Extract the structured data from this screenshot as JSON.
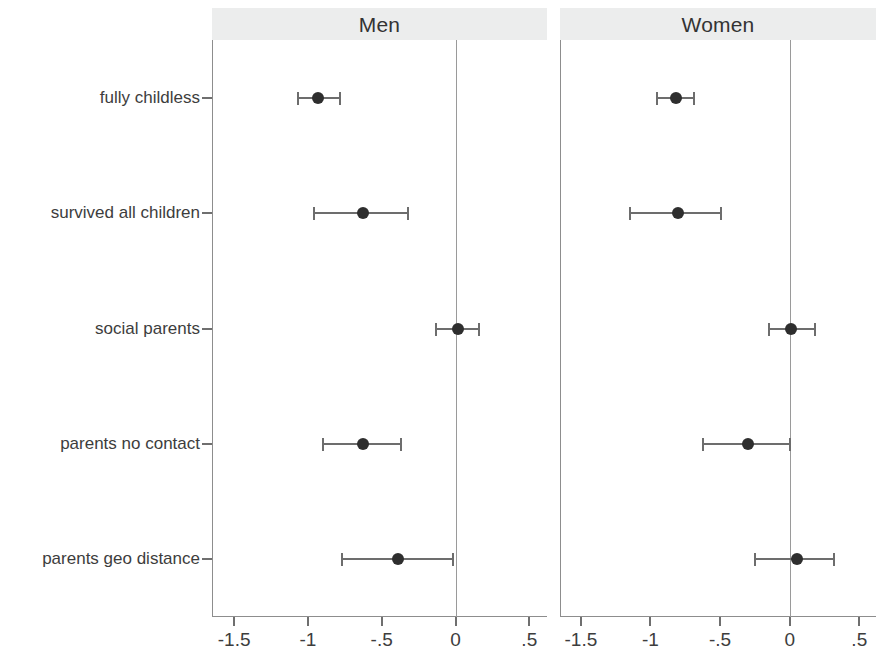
{
  "chart_data": {
    "type": "scatter",
    "title": "",
    "subtitle": "",
    "xlabel": "",
    "ylabel": "",
    "grid": false,
    "legend_position": "none",
    "reference_line": 0,
    "categories": [
      "fully childless",
      "survived all children",
      "social parents",
      "parents no contact",
      "parents geo distance"
    ],
    "panels": [
      {
        "name": "men",
        "label": "Men",
        "xlim": [
          -1.65,
          0.62
        ],
        "xticks": [
          -1.5,
          -1,
          -0.5,
          0,
          0.5
        ],
        "xticklabels": [
          "-1.5",
          "-1",
          "-.5",
          "0",
          ".5"
        ],
        "series": [
          {
            "category": "fully childless",
            "value": -0.93,
            "ci_low": -1.07,
            "ci_high": -0.78
          },
          {
            "category": "survived all children",
            "value": -0.63,
            "ci_low": -0.96,
            "ci_high": -0.32
          },
          {
            "category": "social parents",
            "value": 0.02,
            "ci_low": -0.13,
            "ci_high": 0.16
          },
          {
            "category": "parents no contact",
            "value": -0.63,
            "ci_low": -0.9,
            "ci_high": -0.37
          },
          {
            "category": "parents geo distance",
            "value": -0.39,
            "ci_low": -0.77,
            "ci_high": -0.02
          }
        ]
      },
      {
        "name": "women",
        "label": "Women",
        "xlim": [
          -1.65,
          0.62
        ],
        "xticks": [
          -1.5,
          -1,
          -0.5,
          0,
          0.5
        ],
        "xticklabels": [
          "-1.5",
          "-1",
          "-.5",
          "0",
          ".5"
        ],
        "series": [
          {
            "category": "fully childless",
            "value": -0.82,
            "ci_low": -0.95,
            "ci_high": -0.69
          },
          {
            "category": "survived all children",
            "value": -0.8,
            "ci_low": -1.15,
            "ci_high": -0.49
          },
          {
            "category": "social parents",
            "value": 0.01,
            "ci_low": -0.15,
            "ci_high": 0.18
          },
          {
            "category": "parents no contact",
            "value": -0.3,
            "ci_low": -0.62,
            "ci_high": 0.0
          },
          {
            "category": "parents geo distance",
            "value": 0.05,
            "ci_low": -0.25,
            "ci_high": 0.32
          }
        ]
      }
    ],
    "colors": {
      "point": "#2e2e2e",
      "interval": "#6d6d6d",
      "axis": "#8d8d8d",
      "header_background": "#eceded",
      "text": "#3d3d3d"
    }
  }
}
